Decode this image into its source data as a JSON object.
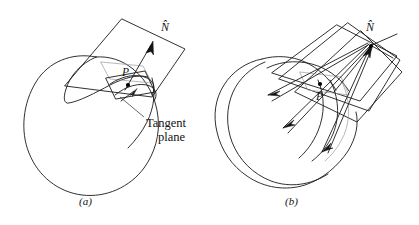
{
  "figure": {
    "type": "geometry-diagram",
    "background_color": "#ffffff",
    "line_color": "#1a1a1a",
    "faint_line_color": "#9a9a9a"
  },
  "panel_a": {
    "caption": "(a)",
    "normal_label": "N̂",
    "normal_label_base": "N",
    "point_label": "P",
    "annotation_line1": "Tangent",
    "annotation_line2": "plane",
    "annotation_full": "Tangent plane",
    "plane_count": 1
  },
  "panel_b": {
    "caption": "(b)",
    "normal_label": "N̂",
    "normal_label_base": "N",
    "point_label": "P",
    "plane_count": 3
  }
}
